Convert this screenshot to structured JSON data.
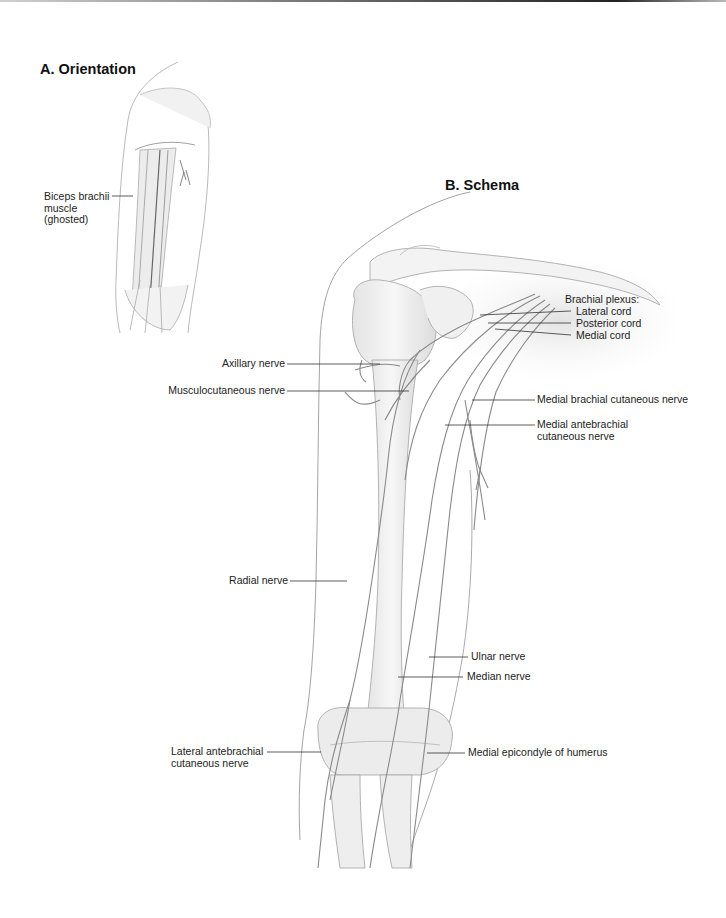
{
  "figure": {
    "panels": [
      {
        "id": "A",
        "title": "A. Orientation",
        "labels": [
          {
            "id": "biceps",
            "lines": [
              "Biceps brachii",
              "muscle",
              "(ghosted)"
            ]
          }
        ]
      },
      {
        "id": "B",
        "title": "B. Schema",
        "labels": [
          {
            "id": "brachial_plexus",
            "text": "Brachial plexus:"
          },
          {
            "id": "lateral_cord",
            "text": "Lateral cord"
          },
          {
            "id": "posterior_cord",
            "text": "Posterior cord"
          },
          {
            "id": "medial_cord",
            "text": "Medial cord"
          },
          {
            "id": "axillary_nerve",
            "text": "Axillary nerve"
          },
          {
            "id": "musculocutaneous_nerve",
            "text": "Musculocutaneous nerve"
          },
          {
            "id": "medial_brachial_cutaneous_nerve",
            "text": "Medial brachial cutaneous nerve"
          },
          {
            "id": "medial_antebrachial_cutaneous_nerve",
            "lines": [
              "Medial antebrachial",
              "cutaneous nerve"
            ]
          },
          {
            "id": "radial_nerve",
            "text": "Radial nerve"
          },
          {
            "id": "ulnar_nerve",
            "text": "Ulnar nerve"
          },
          {
            "id": "median_nerve",
            "text": "Median nerve"
          },
          {
            "id": "lateral_antebrachial_cutaneous_nerve",
            "lines": [
              "Lateral antebrachial",
              "cutaneous nerve"
            ]
          },
          {
            "id": "medial_epicondyle",
            "text": "Medial epicondyle of humerus"
          }
        ]
      }
    ]
  },
  "colors": {
    "leader_line": "#333333",
    "outline": "#9a9a9a",
    "nerve": "#8c8c8c",
    "bone_fill": "#efefef"
  }
}
